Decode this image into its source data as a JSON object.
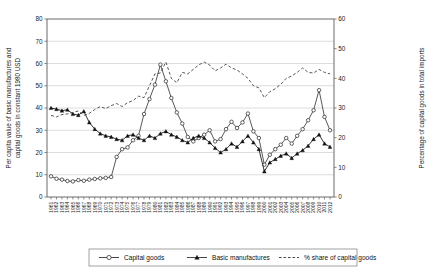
{
  "chart_data": {
    "type": "line",
    "title": "",
    "xlabel": "",
    "ylabel": "Per capita value of basic manufactures and capital goods in constant 1980 USD",
    "y2label": "Percentage of capital goods in total imports",
    "ylim": [
      0,
      80
    ],
    "y2lim": [
      0,
      60
    ],
    "ytick_step": 10,
    "y2tick_step": 10,
    "grid": true,
    "legend_position": "bottom",
    "yticks": [
      "0",
      "10",
      "20",
      "30",
      "40",
      "50",
      "60",
      "70",
      "80"
    ],
    "y2ticks": [
      "0",
      "10",
      "20",
      "30",
      "40",
      "50",
      "60"
    ],
    "categories": [
      "1961",
      "1962",
      "1963",
      "1964",
      "1965",
      "1966",
      "1967",
      "1968",
      "1969",
      "1970",
      "1971",
      "1972",
      "1973",
      "1974",
      "1975",
      "1976",
      "1977",
      "1978",
      "1979",
      "1980",
      "1981",
      "1982",
      "1983",
      "1984",
      "1985",
      "1986",
      "1987",
      "1988",
      "1989",
      "1990",
      "1991",
      "1992",
      "1993",
      "1994",
      "1995",
      "1996",
      "1997",
      "1998",
      "1999",
      "2000",
      "2001",
      "2002",
      "2003",
      "2004",
      "2005",
      "2006",
      "2007",
      "2008",
      "2009",
      "2010",
      "2011",
      "2012"
    ],
    "series": [
      {
        "name": "Capital goods",
        "marker": "open-circle",
        "axis": "left",
        "values": [
          9.3,
          8.2,
          7.8,
          7.2,
          7.0,
          7.6,
          7.3,
          7.8,
          8.1,
          8.4,
          8.6,
          9.0,
          18.0,
          21.5,
          22.3,
          25.5,
          27.5,
          37.3,
          44.0,
          50.5,
          59.5,
          52.0,
          44.5,
          38.0,
          33.0,
          27.0,
          25.0,
          26.5,
          28.0,
          30.0,
          25.0,
          26.0,
          30.5,
          33.8,
          31.0,
          33.5,
          37.5,
          29.5,
          26.5,
          14.5,
          19.0,
          21.5,
          23.5,
          26.5,
          24.0,
          27.5,
          30.5,
          34.5,
          39.0,
          48.0,
          36.0,
          30.0
        ]
      },
      {
        "name": "Basic manufactures",
        "marker": "filled-triangle",
        "axis": "left",
        "values": [
          40.0,
          39.5,
          38.8,
          39.2,
          37.3,
          36.8,
          38.5,
          33.5,
          30.5,
          28.5,
          27.5,
          27.0,
          26.0,
          25.5,
          27.5,
          28.0,
          26.5,
          25.5,
          27.5,
          26.5,
          28.5,
          29.5,
          28.0,
          27.0,
          25.5,
          24.5,
          26.5,
          27.5,
          26.5,
          24.5,
          22.0,
          20.0,
          21.5,
          24.0,
          22.5,
          25.0,
          27.5,
          24.5,
          21.5,
          11.5,
          15.5,
          17.0,
          18.5,
          19.5,
          17.5,
          19.5,
          21.0,
          23.0,
          26.0,
          28.0,
          24.0,
          22.5
        ]
      },
      {
        "name": "% share of capital goods",
        "marker": "none",
        "axis": "right",
        "values": [
          27.5,
          27.0,
          27.8,
          28.0,
          28.5,
          29.0,
          27.5,
          28.2,
          29.5,
          30.5,
          29.8,
          30.8,
          31.5,
          30.5,
          31.8,
          32.5,
          34.0,
          33.5,
          37.5,
          41.5,
          41.8,
          45.5,
          40.0,
          38.5,
          42.0,
          41.5,
          43.0,
          44.5,
          45.5,
          44.5,
          42.5,
          43.5,
          44.8,
          43.5,
          42.8,
          41.5,
          40.0,
          37.5,
          36.8,
          33.5,
          35.5,
          36.5,
          38.0,
          40.0,
          40.8,
          42.0,
          43.5,
          42.0,
          41.8,
          43.0,
          42.0,
          41.5
        ]
      }
    ]
  },
  "legend": {
    "items": [
      {
        "label": "Capital goods",
        "style": "line-open-circle"
      },
      {
        "label": "Basic manufactures",
        "style": "line-filled-triangle"
      },
      {
        "label": "% share of capital goods",
        "style": "dashed-line"
      }
    ]
  }
}
